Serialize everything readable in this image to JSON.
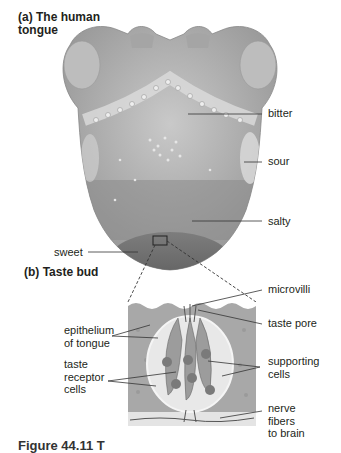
{
  "panel_a": {
    "title_line1": "(a)  The human",
    "title_line2": "tongue",
    "labels": {
      "bitter": "bitter",
      "sour": "sour",
      "salty": "salty",
      "sweet": "sweet"
    }
  },
  "panel_b": {
    "title": "(b)  Taste bud",
    "labels": {
      "microvilli": "microvilli",
      "taste_pore": "taste pore",
      "epithelium_line1": "epithelium",
      "epithelium_line2": "of tongue",
      "taste_line1": "taste",
      "taste_line2": "receptor",
      "taste_line3": "cells",
      "supporting_line1": "supporting",
      "supporting_line2": "cells",
      "nerve_line1": "nerve",
      "nerve_line2": "fibers",
      "nerve_line3": "to brain"
    }
  },
  "caption": "Figure 44.11  T"
}
